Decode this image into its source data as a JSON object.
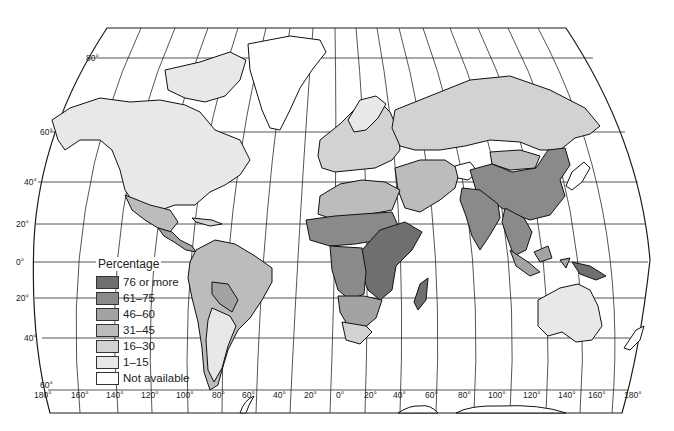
{
  "map": {
    "title": "",
    "projection": "world-robinson-style",
    "latitude_labels": [
      "80°",
      "60°",
      "40°",
      "20°",
      "0°",
      "20°",
      "40°",
      "60°"
    ],
    "longitude_labels": [
      "180°",
      "160°",
      "140°",
      "120°",
      "100°",
      "80°",
      "60°",
      "40°",
      "20°",
      "0°",
      "20°",
      "40°",
      "60°",
      "80°",
      "100°",
      "120°",
      "140°",
      "160°",
      "180°"
    ]
  },
  "legend": {
    "title": "Percentage",
    "items": [
      {
        "label": "76 or more",
        "color": "#6f6f6f"
      },
      {
        "label": "61–75",
        "color": "#8a8a8a"
      },
      {
        "label": "46–60",
        "color": "#a3a3a3"
      },
      {
        "label": "31–45",
        "color": "#bcbcbc"
      },
      {
        "label": "16–30",
        "color": "#d2d2d2"
      },
      {
        "label": "1–15",
        "color": "#e8e8e8"
      },
      {
        "label": "Not available",
        "color": "#ffffff"
      }
    ]
  },
  "regions": {
    "north_america": {
      "category": "1–15",
      "color": "#e8e8e8"
    },
    "greenland": {
      "category": "Not available",
      "color": "#ffffff"
    },
    "mexico": {
      "category": "31–45",
      "color": "#bcbcbc"
    },
    "central_america": {
      "category": "46–60",
      "color": "#a3a3a3"
    },
    "south_america": {
      "category": "31–45",
      "color": "#bcbcbc"
    },
    "bolivia_paraguay": {
      "category": "46–60",
      "color": "#a3a3a3"
    },
    "argentina": {
      "category": "1–15",
      "color": "#e8e8e8"
    },
    "europe": {
      "category": "16–30",
      "color": "#d2d2d2"
    },
    "russia": {
      "category": "16–30",
      "color": "#d2d2d2"
    },
    "north_africa": {
      "category": "31–45",
      "color": "#bcbcbc"
    },
    "sahel": {
      "category": "61–75",
      "color": "#8a8a8a"
    },
    "central_east_africa": {
      "category": "76 or more",
      "color": "#6f6f6f"
    },
    "southern_africa": {
      "category": "46–60",
      "color": "#a3a3a3"
    },
    "south_africa": {
      "category": "16–30",
      "color": "#d2d2d2"
    },
    "madagascar": {
      "category": "76 or more",
      "color": "#6f6f6f"
    },
    "middle_east": {
      "category": "31–45",
      "color": "#bcbcbc"
    },
    "china": {
      "category": "61–75",
      "color": "#8a8a8a"
    },
    "mongolia": {
      "category": "31–45",
      "color": "#bcbcbc"
    },
    "india": {
      "category": "61–75",
      "color": "#8a8a8a"
    },
    "southeast_asia": {
      "category": "61–75",
      "color": "#8a8a8a"
    },
    "indonesia": {
      "category": "46–60",
      "color": "#a3a3a3"
    },
    "papua_new_guinea": {
      "category": "76 or more",
      "color": "#6f6f6f"
    },
    "australia": {
      "category": "1–15",
      "color": "#e8e8e8"
    },
    "new_zealand": {
      "category": "Not available",
      "color": "#ffffff"
    },
    "japan": {
      "category": "Not available",
      "color": "#ffffff"
    },
    "afghanistan": {
      "category": "Not available",
      "color": "#ffffff"
    }
  }
}
